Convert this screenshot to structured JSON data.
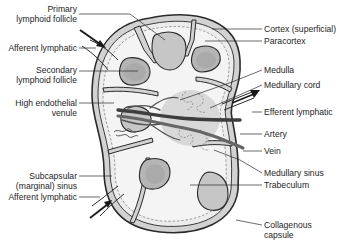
{
  "diagram": {
    "colors": {
      "background": "#ffffff",
      "outline": "#2a2a2a",
      "capsule_fill": "#cfcfcf",
      "sinus_fill": "#ebebeb",
      "follicle_fill": "#c8c8c8",
      "germinal_fill": "#b0b0b0",
      "medulla_fill": "#d9d9d9",
      "artery": "#4a4a4a",
      "vein": "#6a6a6a",
      "leader_line": "#2a2a2a"
    },
    "labels_left": [
      {
        "id": "primary-lymphoid-follicle",
        "lines": [
          "Primary",
          "lymphoid follicle"
        ]
      },
      {
        "id": "afferent-lymphatic-top",
        "lines": [
          "Afferent lymphatic"
        ]
      },
      {
        "id": "secondary-lymphoid-follicle",
        "lines": [
          "Secondary",
          "lymphoid follicle"
        ]
      },
      {
        "id": "high-endothelial-venule",
        "lines": [
          "High endothelial",
          "venule"
        ]
      },
      {
        "id": "subcapsular-sinus",
        "lines": [
          "Subcapsular",
          "(marginal) sinus"
        ]
      },
      {
        "id": "afferent-lymphatic-bottom",
        "lines": [
          "Afferent lymphatic"
        ]
      }
    ],
    "labels_right": [
      {
        "id": "cortex-superficial",
        "lines": [
          "Cortex (superficial)"
        ]
      },
      {
        "id": "paracortex",
        "lines": [
          "Paracortex"
        ]
      },
      {
        "id": "medulla",
        "lines": [
          "Medulla"
        ]
      },
      {
        "id": "medullary-cord",
        "lines": [
          "Medullary cord"
        ]
      },
      {
        "id": "efferent-lymphatic",
        "lines": [
          "Efferent lymphatic"
        ]
      },
      {
        "id": "artery",
        "lines": [
          "Artery"
        ]
      },
      {
        "id": "vein",
        "lines": [
          "Vein"
        ]
      },
      {
        "id": "medullary-sinus",
        "lines": [
          "Medullary sinus"
        ]
      },
      {
        "id": "trabeculum",
        "lines": [
          "Trabeculum"
        ]
      },
      {
        "id": "collagenous-capsule",
        "lines": [
          "Collagenous",
          "capsule"
        ]
      }
    ]
  }
}
